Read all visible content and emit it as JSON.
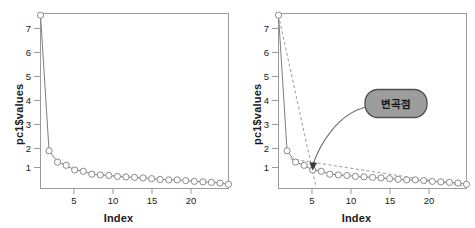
{
  "chart_data": [
    {
      "type": "line",
      "panel": "left",
      "title": "",
      "xlabel": "Index",
      "ylabel": "pc1$values",
      "xlim": [
        1,
        23
      ],
      "ylim": [
        0.25,
        7.35
      ],
      "xticks": [
        5,
        10,
        15,
        20
      ],
      "yticks": [
        1,
        2,
        3,
        4,
        5,
        6,
        7
      ],
      "grid": false,
      "legend": "none",
      "marker": "open-circle",
      "x": [
        1,
        2,
        3,
        4,
        5,
        6,
        7,
        8,
        9,
        10,
        11,
        12,
        13,
        14,
        15,
        16,
        17,
        18,
        19,
        20,
        21,
        22,
        23
      ],
      "values": [
        7.28,
        1.78,
        1.32,
        1.19,
        1.0,
        0.95,
        0.83,
        0.8,
        0.78,
        0.74,
        0.72,
        0.7,
        0.68,
        0.65,
        0.62,
        0.6,
        0.6,
        0.57,
        0.54,
        0.52,
        0.5,
        0.47,
        0.42
      ]
    },
    {
      "type": "line",
      "panel": "right",
      "title": "",
      "xlabel": "Index",
      "ylabel": "pc1$values",
      "xlim": [
        1,
        23
      ],
      "ylim": [
        0.25,
        7.35
      ],
      "xticks": [
        5,
        10,
        15,
        20
      ],
      "yticks": [
        1,
        2,
        3,
        4,
        5,
        6,
        7
      ],
      "grid": false,
      "legend": "none",
      "marker": "open-circle",
      "x": [
        1,
        2,
        3,
        4,
        5,
        6,
        7,
        8,
        9,
        10,
        11,
        12,
        13,
        14,
        15,
        16,
        17,
        18,
        19,
        20,
        21,
        22,
        23
      ],
      "values": [
        7.28,
        1.78,
        1.32,
        1.19,
        1.0,
        0.95,
        0.83,
        0.8,
        0.78,
        0.74,
        0.72,
        0.7,
        0.68,
        0.65,
        0.62,
        0.6,
        0.6,
        0.57,
        0.54,
        0.52,
        0.5,
        0.47,
        0.42
      ],
      "annotations": {
        "callout_label": "변곡점",
        "elbow_index": 5,
        "elbow_value": 1.0,
        "guide_line_steep": {
          "style": "dashed",
          "from": [
            1,
            7.28
          ],
          "to": [
            5.4,
            0.3
          ]
        },
        "guide_line_shallow": {
          "style": "dashed",
          "from": [
            2.4,
            1.45
          ],
          "to": [
            23,
            0.35
          ]
        }
      }
    }
  ],
  "labels": {
    "xlabel": "Index",
    "ylabel": "pc1$values",
    "callout": "변곡점"
  },
  "colors": {
    "line": "#7d7d7d",
    "marker_stroke": "#8a8a8a",
    "frame": "#9b9b9b",
    "text": "#1a1a1a",
    "callout_fill": "#9d9d9d",
    "callout_border": "#4f4f4f",
    "background": "#ffffff"
  }
}
